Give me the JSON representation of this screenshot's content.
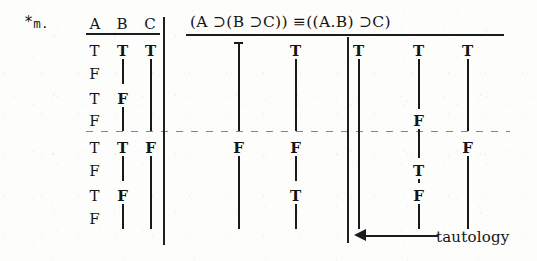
{
  "problem": {
    "marker": "*",
    "number": "m."
  },
  "table": {
    "variable_headers": [
      "A",
      "B",
      "C"
    ],
    "formula": "(A ⊃(B ⊃C)) ≡((A.B) ⊃C)",
    "row_count": 8,
    "variables": {
      "A": [
        "T",
        "F",
        "T",
        "F",
        "T",
        "F",
        "T",
        "F"
      ],
      "B": [
        "T",
        "",
        "F",
        "",
        "T",
        "",
        "F",
        ""
      ],
      "C": [
        "T",
        "",
        "",
        "",
        "F",
        "",
        "",
        ""
      ]
    },
    "variable_columns": [
      {
        "name": "A",
        "entries": [
          {
            "row": 1,
            "value": "T",
            "ditto_rows": 0
          },
          {
            "row": 2,
            "value": "F",
            "ditto_rows": 0
          },
          {
            "row": 3,
            "value": "T",
            "ditto_rows": 0
          },
          {
            "row": 4,
            "value": "F",
            "ditto_rows": 0
          },
          {
            "row": 5,
            "value": "T",
            "ditto_rows": 0
          },
          {
            "row": 6,
            "value": "F",
            "ditto_rows": 0
          },
          {
            "row": 7,
            "value": "T",
            "ditto_rows": 0
          },
          {
            "row": 8,
            "value": "F",
            "ditto_rows": 0
          }
        ]
      },
      {
        "name": "B",
        "entries": [
          {
            "row": 1,
            "value": "T",
            "ditto_rows": 2
          },
          {
            "row": 3,
            "value": "F",
            "ditto_rows": 2
          },
          {
            "row": 5,
            "value": "T",
            "ditto_rows": 2
          },
          {
            "row": 7,
            "value": "F",
            "ditto_rows": 2
          }
        ]
      },
      {
        "name": "C",
        "entries": [
          {
            "row": 1,
            "value": "T",
            "ditto_rows": 4
          },
          {
            "row": 5,
            "value": "F",
            "ditto_rows": 4
          }
        ]
      }
    ],
    "formula_columns": [
      {
        "position": "under-main-horseshoe-left",
        "entries": [
          {
            "row": 1,
            "value": "",
            "ditto_rows": 4
          },
          {
            "row": 5,
            "value": "F",
            "ditto_rows": 4
          }
        ]
      },
      {
        "position": "under-inner-horseshoe",
        "entries": [
          {
            "row": 1,
            "value": "T",
            "ditto_rows": 4
          },
          {
            "row": 5,
            "value": "F",
            "ditto_rows": 2
          },
          {
            "row": 7,
            "value": "T",
            "ditto_rows": 2
          }
        ]
      },
      {
        "position": "under-triple-bar",
        "entries": [
          {
            "row": 1,
            "value": "T",
            "ditto_rows": 8
          }
        ]
      },
      {
        "position": "under-dot",
        "entries": [
          {
            "row": 1,
            "value": "T",
            "ditto_rows": 3
          },
          {
            "row": 4,
            "value": "F",
            "ditto_rows": 2
          },
          {
            "row": 6,
            "value": "T",
            "ditto_rows": 1
          },
          {
            "row": 7,
            "value": "F",
            "ditto_rows": 2
          }
        ]
      },
      {
        "position": "under-final-horseshoe",
        "entries": [
          {
            "row": 1,
            "value": "T",
            "ditto_rows": 4
          },
          {
            "row": 5,
            "value": "F",
            "ditto_rows": 4
          }
        ]
      }
    ]
  },
  "annotation": {
    "label": "tautology",
    "arrow_direction": "left",
    "points_to": "under-triple-bar"
  }
}
